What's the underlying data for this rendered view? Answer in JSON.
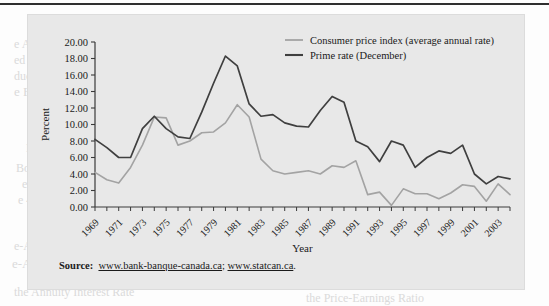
{
  "figure": {
    "source_prefix": "Source:",
    "source_url_1": "www.bank-banque-canada.ca",
    "source_separator": "; ",
    "source_url_2": "www.statcan.ca",
    "source_suffix": "."
  },
  "colors": {
    "panel_background": "#e8e8e8",
    "cpi_line": "#a3a3a3",
    "prime_line": "#3f3f3f",
    "axis": "#3a3a3a",
    "text": "#1a1a1a"
  },
  "ghost_text": [
    {
      "t": "Compound Value",
      "x": 32,
      "y": 16,
      "s": 13
    },
    {
      "t": "e Analysis  438",
      "x": 14,
      "y": 36,
      "s": 12
    },
    {
      "t": "ed  440  Collection  440",
      "x": 14,
      "y": 52,
      "s": 12
    },
    {
      "t": "duction  442",
      "x": 14,
      "y": 68,
      "s": 12
    },
    {
      "t": "e Bond Valuation",
      "x": 14,
      "y": 84,
      "s": 13
    },
    {
      "t": "443",
      "x": 40,
      "y": 100,
      "s": 12
    },
    {
      "t": "ree Factors",
      "x": 40,
      "y": 124,
      "s": 12
    },
    {
      "t": "Bond  446",
      "x": 26,
      "y": 140,
      "s": 12
    },
    {
      "t": "Bonds in Advance",
      "x": 16,
      "y": 160,
      "s": 12
    },
    {
      "t": "ents  448",
      "x": 22,
      "y": 176,
      "s": 12
    },
    {
      "t": "e  450",
      "x": 18,
      "y": 192,
      "s": 12
    },
    {
      "t": "e-Annuity  452",
      "x": 14,
      "y": 238,
      "s": 12
    },
    {
      "t": "e-Annuity in Advance",
      "x": 12,
      "y": 256,
      "s": 13
    },
    {
      "t": "the Annuity Interest Rate",
      "x": 14,
      "y": 284,
      "s": 12
    },
    {
      "t": "ting of Market Interest Rates",
      "x": 300,
      "y": 12,
      "s": 13
    },
    {
      "t": "Estimating Yields Maturity from",
      "x": 300,
      "y": 30,
      "s": 13
    },
    {
      "t": "Coupon Rate  455",
      "x": 318,
      "y": 46,
      "s": 12
    },
    {
      "t": "Semiannual Interest and Bond Prices",
      "x": 300,
      "y": 64,
      "s": 13
    },
    {
      "t": "  457",
      "x": 336,
      "y": 82,
      "s": 12
    },
    {
      "t": "Valuation of Preferred Stock   459",
      "x": 300,
      "y": 104,
      "s": 13
    },
    {
      "t": "Determining the Required Rate of",
      "x": 310,
      "y": 122,
      "s": 13
    },
    {
      "t": "Return from the Market Price  460",
      "x": 318,
      "y": 138,
      "s": 12
    },
    {
      "t": "Common Stock Valuation  461",
      "x": 300,
      "y": 156,
      "s": 13
    },
    {
      "t": "Valuation of a Firm with a",
      "x": 316,
      "y": 176,
      "s": 12
    },
    {
      "t": "Constant Growth in Dividends  462",
      "x": 310,
      "y": 194,
      "s": 12
    },
    {
      "t": "Stock Valuation Based on Future",
      "x": 300,
      "y": 228,
      "s": 13
    },
    {
      "t": "Determining the Inputs for the",
      "x": 306,
      "y": 252,
      "s": 13
    },
    {
      "t": "Dividend Valuation Model  467",
      "x": 312,
      "y": 270,
      "s": 13
    },
    {
      "t": "the Price-Earnings Ratio",
      "x": 306,
      "y": 290,
      "s": 12
    }
  ],
  "chart_data": {
    "type": "line",
    "title": "",
    "xlabel": "Year",
    "ylabel": "Percent",
    "ylim": [
      0,
      20
    ],
    "ytick_step": 2,
    "ytick_format": "2 decimals",
    "yticks": [
      "0.00",
      "2.00",
      "4.00",
      "6.00",
      "8.00",
      "10.00",
      "12.00",
      "14.00",
      "16.00",
      "18.00",
      "20.00"
    ],
    "xlim": [
      1969,
      2004
    ],
    "xticks_labeled": [
      1969,
      1971,
      1973,
      1975,
      1977,
      1979,
      1981,
      1983,
      1985,
      1987,
      1989,
      1991,
      1993,
      1995,
      1997,
      1999,
      2001,
      2003
    ],
    "xtick_minor_every": 1,
    "xtick_label_rotation": -45,
    "grid": false,
    "legend_position": "top-right inside",
    "x": [
      1969,
      1970,
      1971,
      1972,
      1973,
      1974,
      1975,
      1976,
      1977,
      1978,
      1979,
      1980,
      1981,
      1982,
      1983,
      1984,
      1985,
      1986,
      1987,
      1988,
      1989,
      1990,
      1991,
      1992,
      1993,
      1994,
      1995,
      1996,
      1997,
      1998,
      1999,
      2000,
      2001,
      2002,
      2003,
      2004
    ],
    "series": [
      {
        "name": "Consumer price index (average annual rate)",
        "color": "#a3a3a3",
        "values": [
          4.2,
          3.3,
          2.9,
          4.8,
          7.5,
          10.9,
          10.8,
          7.5,
          8.0,
          9.0,
          9.1,
          10.2,
          12.4,
          10.9,
          5.8,
          4.4,
          4.0,
          4.2,
          4.4,
          4.0,
          5.0,
          4.8,
          5.6,
          1.5,
          1.8,
          0.2,
          2.2,
          1.6,
          1.6,
          1.0,
          1.7,
          2.7,
          2.5,
          0.7,
          2.8,
          1.5
        ]
      },
      {
        "name": "Prime rate (December)",
        "color": "#3f3f3f",
        "values": [
          8.2,
          7.2,
          6.0,
          6.0,
          9.5,
          11.0,
          9.5,
          8.5,
          8.3,
          11.5,
          15.0,
          18.3,
          17.1,
          12.5,
          11.0,
          11.2,
          10.2,
          9.8,
          9.7,
          11.7,
          13.4,
          12.7,
          8.0,
          7.3,
          5.5,
          8.0,
          7.5,
          4.8,
          6.0,
          6.8,
          6.5,
          7.5,
          4.0,
          2.8,
          3.7,
          3.4
        ]
      }
    ]
  }
}
